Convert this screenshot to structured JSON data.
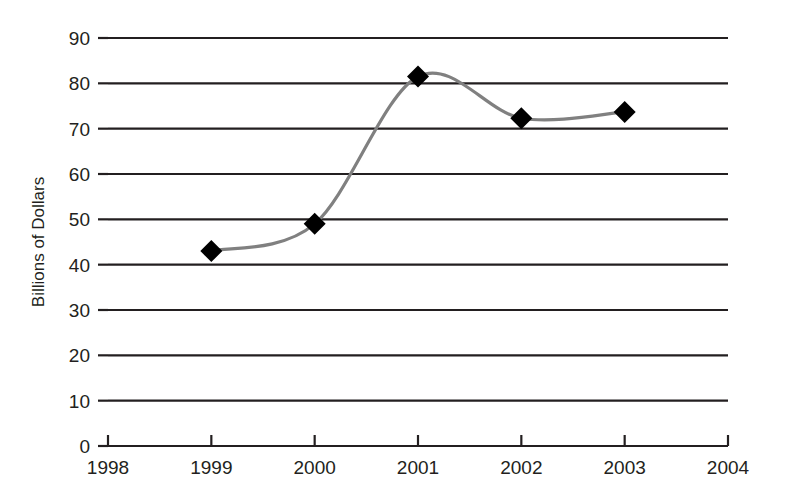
{
  "chart_data": {
    "type": "line",
    "title": "",
    "subtitle": "",
    "xlabel": "",
    "ylabel": "Billions of Dollars",
    "x": [
      1999,
      2000,
      2001,
      2002,
      2003
    ],
    "values": [
      43,
      49,
      81.5,
      72.3,
      73.7
    ],
    "series": [
      {
        "name": "",
        "x": [
          1999,
          2000,
          2001,
          2002,
          2003
        ],
        "values": [
          43,
          49,
          81.5,
          72.3,
          73.7
        ]
      }
    ],
    "xlim": [
      1998,
      2004
    ],
    "ylim": [
      0,
      90
    ],
    "x_ticks": [
      "1998",
      "1999",
      "2000",
      "2001",
      "2002",
      "2003",
      "2004"
    ],
    "x_tick_values": [
      1998,
      1999,
      2000,
      2001,
      2002,
      2003,
      2004
    ],
    "y_ticks": [
      "0",
      "10",
      "20",
      "30",
      "40",
      "50",
      "60",
      "70",
      "80",
      "90"
    ],
    "y_tick_values": [
      0,
      10,
      20,
      30,
      40,
      50,
      60,
      70,
      80,
      90
    ],
    "grid": true,
    "grid_axis": "y",
    "legend": false,
    "legend_position": "none",
    "marker": "diamond",
    "marker_color": "#000000",
    "line_color": "#808080",
    "grid_color": "#231f20",
    "axis_color": "#231f20",
    "background_color": "#ffffff",
    "smoothing": "spline"
  }
}
